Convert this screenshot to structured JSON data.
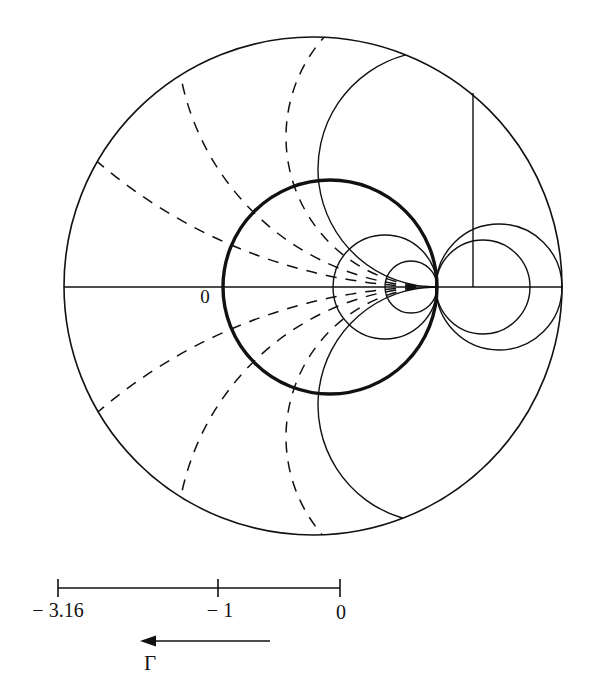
{
  "figure": {
    "type": "smith-chart",
    "title": "",
    "background": "#ffffff",
    "ink": "#111111"
  },
  "labels": {
    "origin": "0",
    "gamma": "Γ",
    "scale_left": "− 3.16",
    "scale_mid": "− 1",
    "scale_right": "0"
  },
  "chart_data": {
    "type": "scatter",
    "xlabel": "Γ",
    "ylabel": "",
    "grid": true,
    "legend_position": "none",
    "axis_note": "Reflection-coefficient plane; horizontal axis is the real Γ axis",
    "annotations": [
      {
        "text": "0",
        "x": 205,
        "y": 303,
        "note": "origin marker left of bold circle on real axis"
      },
      {
        "text": "Γ",
        "x": 148,
        "y": 668,
        "note": "direction-of-travel arrow label"
      }
    ],
    "scale_bar": {
      "y": 588,
      "x_start": 58,
      "x_end": 340,
      "ticks": [
        {
          "label": "− 3.16",
          "x": 58,
          "value": -3.16
        },
        {
          "label": "− 1",
          "x": 218,
          "value": -1
        },
        {
          "label": "0",
          "x": 340,
          "value": 0
        }
      ],
      "arrow": {
        "x_from": 270,
        "x_to": 140,
        "y": 641,
        "direction": "left"
      }
    },
    "geometry": {
      "outer_circle": {
        "cx": 313,
        "cy": 286,
        "r": 249,
        "style": "solid",
        "weight": 1.6
      },
      "tangent_point": {
        "x": 436,
        "y": 287
      },
      "real_axis": {
        "x1": 64,
        "x2": 563,
        "y": 287,
        "style": "solid"
      },
      "bold_circle": {
        "cx": 330,
        "cy": 287,
        "r": 107,
        "style": "solid",
        "weight": 3.4,
        "note": "highlighted constant-resistance circle"
      },
      "resistance_circles": [
        {
          "cx": 330,
          "cy": 287,
          "r": 107,
          "weight": 3.4,
          "highlight": true
        },
        {
          "cx": 385,
          "cy": 287,
          "r": 52,
          "weight": 1.4,
          "highlight": false
        },
        {
          "cx": 411,
          "cy": 287,
          "r": 26,
          "weight": 1.4,
          "highlight": false
        },
        {
          "cx": 483,
          "cy": 287,
          "r": 47,
          "weight": 1.4,
          "highlight": false
        },
        {
          "cx": 499,
          "cy": 287,
          "r": 63,
          "weight": 1.4,
          "highlight": false
        }
      ],
      "reactance_arcs_dashed": {
        "style": "dashed",
        "dash": "11 9",
        "weight": 1.5,
        "count": 12,
        "note": "arcs through the tangent point, terminating on the outer circle"
      },
      "reactance_arcs_solid": {
        "style": "solid",
        "weight": 1.4,
        "count": 4,
        "note": "solid constant-reactance arcs on the right half including the vertical line"
      },
      "vertical_line": {
        "x": 473,
        "y_top": 93,
        "y_bottom": 287,
        "style": "solid"
      }
    }
  }
}
